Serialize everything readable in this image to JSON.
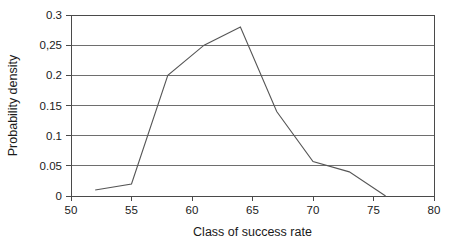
{
  "chart_data": {
    "type": "line",
    "title": "",
    "subtitle": "",
    "xlabel": "Class of success rate",
    "ylabel": "Probability density",
    "xlim": [
      50,
      80
    ],
    "ylim": [
      0,
      0.3
    ],
    "grid": "horizontal",
    "legend": "none",
    "x_ticks": [
      50,
      55,
      60,
      65,
      70,
      75,
      80
    ],
    "x_tick_labels": [
      "50",
      "55",
      "60",
      "65",
      "70",
      "75",
      "80"
    ],
    "y_ticks": [
      0,
      0.05,
      0.1,
      0.15,
      0.2,
      0.25,
      0.3
    ],
    "y_tick_labels": [
      "0",
      "0.05",
      "0.1",
      "0.15",
      "0.2",
      "0,25",
      "0.3"
    ],
    "series": [
      {
        "name": "Probability density",
        "color": "#565656",
        "x": [
          52,
          55,
          58,
          61,
          64,
          67,
          70,
          73,
          76
        ],
        "values": [
          0.01,
          0.02,
          0.2,
          0.25,
          0.28,
          0.14,
          0.057,
          0.04,
          0
        ]
      }
    ]
  },
  "axes": {
    "x_title": "Class of success rate",
    "y_title": "Probability density"
  }
}
